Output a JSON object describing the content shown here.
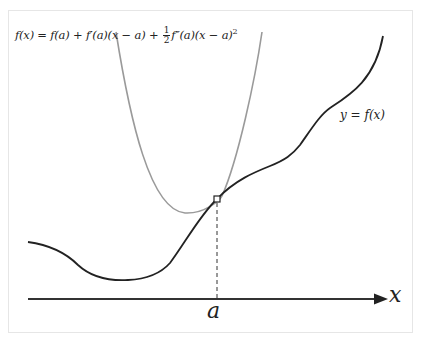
{
  "diagram": {
    "title_formula": {
      "lhs": "f(x) = f(a) + f′(a)(x − a) + ",
      "frac_num": "1",
      "frac_den": "2",
      "rhs": "f″(a)(x − a)",
      "exponent": "2"
    },
    "curve_label": "y = f(x)",
    "x_axis_label": "x",
    "point_label": "a",
    "colors": {
      "curve": "#222222",
      "parabola": "#9a9a9a",
      "axis": "#333333",
      "frame": "#e6e6e6"
    },
    "elements": [
      "function curve y = f(x)",
      "second-order Taylor approximation parabola (gray)",
      "tangent point marker at x = a",
      "dashed vertical drop line from point to x-axis",
      "x-axis with arrowhead"
    ]
  }
}
